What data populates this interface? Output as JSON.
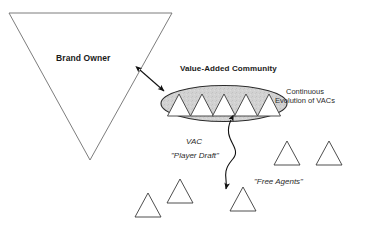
{
  "diagram": {
    "title_brand_owner": "Brand Owner",
    "title_vac": "Value-Added Community",
    "continuous_line1": "Continuous",
    "continuous_line2": "Evolution of VACs",
    "label_vac": "VAC",
    "label_player_draft": "\"Player Draft\"",
    "label_free_agents": "\"Free Agents\"",
    "colors": {
      "stroke": "#555555",
      "ellipse_fill": "#d2d2d2",
      "ellipse_stroke": "#2b2b2b",
      "triangle_stroke": "#3a3a3a",
      "arrow": "#111111",
      "text": "#1a1a1a",
      "background": "#ffffff"
    },
    "shapes": {
      "brand_owner_triangle": {
        "points": "9,13 172,13 90,160",
        "filled": false
      },
      "community_ellipse": {
        "cx": 224,
        "cy": 103.5,
        "rx": 63,
        "ry": 18
      },
      "vac_triangles_count": 5,
      "vac_triangles": [
        {
          "cx": 179,
          "base_y": 116,
          "half_w": 11.5,
          "height": 22
        },
        {
          "cx": 202,
          "base_y": 116,
          "half_w": 11.5,
          "height": 22
        },
        {
          "cx": 224,
          "base_y": 116,
          "half_w": 11.5,
          "height": 22
        },
        {
          "cx": 246,
          "base_y": 116,
          "half_w": 11.5,
          "height": 22
        },
        {
          "cx": 269,
          "base_y": 116,
          "half_w": 11.5,
          "height": 22
        }
      ],
      "free_agent_triangles_count": 5,
      "free_agent_triangles": [
        {
          "cx": 148,
          "base_y": 217,
          "half_w": 13,
          "height": 24
        },
        {
          "cx": 180,
          "base_y": 203,
          "half_w": 13,
          "height": 24
        },
        {
          "cx": 243,
          "base_y": 211,
          "half_w": 13,
          "height": 24
        },
        {
          "cx": 287,
          "base_y": 165,
          "half_w": 13,
          "height": 24
        },
        {
          "cx": 329,
          "base_y": 165,
          "half_w": 13,
          "height": 24
        }
      ],
      "double_arrow_straight": {
        "x1": 139,
        "y1": 69,
        "x2": 165,
        "y2": 92
      },
      "double_arrow_curved": {
        "path": "M 231 120 C 222 140 243 148 232 160 C 222 172 228 178 226 190"
      }
    }
  }
}
